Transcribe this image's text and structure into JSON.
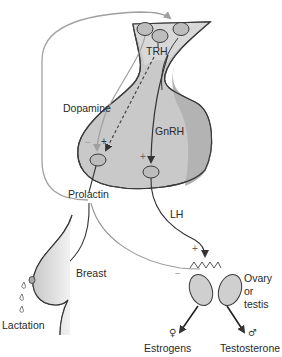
{
  "figure": {
    "type": "hypothalamic-pituitary-gonadal / prolactin regulation diagram",
    "colors": {
      "pituitary_fill": "#c9c9c9",
      "pituitary_posterior_fill": "#b3b3b3",
      "stalk_fill": "#d8d8d8",
      "cell_fill": "#bdbdbd",
      "outline": "#3a3a3a",
      "feedback_line": "#a0a0a0",
      "stimulatory_line": "#3a3a3a",
      "breast_fill": "#d5d5d5",
      "gonad_fill": "#cfcfcf"
    }
  },
  "labels": {
    "trh": "TRH",
    "dopamine": "Dopamine",
    "gnrh": "GnRH",
    "prolactin": "Prolactin",
    "lh": "LH",
    "breast": "Breast",
    "lactation": "Lactation",
    "gonad": [
      "Ovary",
      "or",
      "testis"
    ],
    "estrogens": "Estrogens",
    "testosterone": "Testosterone"
  },
  "symbols": {
    "female": "♀",
    "male": "♂",
    "plus": "+",
    "minus": "−"
  },
  "signs": {
    "dopamine_effect": "−",
    "trh_effect": "+",
    "gnrh_effect": "+",
    "lh_effect": "+",
    "prolactin_on_gonad": "−"
  }
}
